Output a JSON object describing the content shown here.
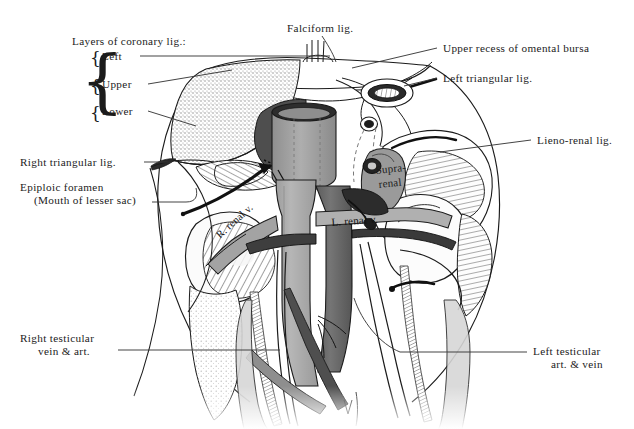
{
  "figure": {
    "background_color": "#ffffff",
    "ink_color": "#1b1b1b"
  },
  "palette": {
    "ink": "#1b1b1b",
    "leader_line": "#3a3a3a",
    "ivc_gray": "#a9a9a9",
    "aorta_dark": "#6b6b6b",
    "vessel_darkest": "#4a4a4a",
    "bare_area_stipple": "#c9c9c9",
    "peritoneum_light": "#e8e8e8",
    "kidney_fill": "#f4f4f4",
    "shadow_gray": "#bdbdbd",
    "white": "#ffffff"
  },
  "labels_left": [
    {
      "id": "layers-heading",
      "text": "Layers of coronary lig.:",
      "x": 72,
      "y": 41
    },
    {
      "id": "layer-left",
      "text": "Left",
      "x": 98,
      "y": 58
    },
    {
      "id": "layer-upper",
      "text": "Upper",
      "x": 98,
      "y": 86
    },
    {
      "id": "layer-lower",
      "text": "Lower",
      "x": 98,
      "y": 113
    },
    {
      "id": "right-triangular-lig",
      "text": "Right triangular lig.",
      "x": 20,
      "y": 163
    },
    {
      "id": "epiploic-foramen-line1",
      "text": "Epiploic foramen",
      "x": 20,
      "y": 187
    },
    {
      "id": "epiploic-foramen-line2",
      "text": "(Mouth of lesser sac)",
      "x": 32,
      "y": 200
    },
    {
      "id": "right-testicular-line1",
      "text": "Right testicular",
      "x": 20,
      "y": 338
    },
    {
      "id": "right-testicular-line2",
      "text": "vein & art.",
      "x": 36,
      "y": 351
    }
  ],
  "labels_right": [
    {
      "id": "upper-recess-omental-bursa",
      "text": "Upper recess of omental bursa",
      "x": 443,
      "y": 48
    },
    {
      "id": "left-triangular-lig",
      "text": "Left triangular lig.",
      "x": 443,
      "y": 78
    },
    {
      "id": "lieno-renal-lig",
      "text": "Lieno-renal lig.",
      "x": 537,
      "y": 141
    },
    {
      "id": "left-testicular-line1",
      "text": "Left testicular",
      "x": 533,
      "y": 351
    },
    {
      "id": "left-testicular-line2",
      "text": "art. & vein",
      "x": 549,
      "y": 364
    }
  ],
  "labels_top": [
    {
      "id": "falciform-lig",
      "text": "Falciform lig.",
      "x": 287,
      "y": 28
    }
  ],
  "labels_overlay": [
    {
      "id": "r-renal-v",
      "text": "R. renal v.",
      "x": 218,
      "y": 238,
      "rotate": -42
    },
    {
      "id": "l-renal-v",
      "text": "L. renal v.",
      "x": 331,
      "y": 222,
      "rotate": -4
    },
    {
      "id": "supra-renal-line1",
      "text": "Supra-",
      "x": 377,
      "y": 171,
      "rotate": -6
    },
    {
      "id": "supra-renal-line2",
      "text": "renal",
      "x": 380,
      "y": 185,
      "rotate": -6
    }
  ],
  "brace": {
    "outer": "{",
    "items": [
      "{",
      "{",
      "{"
    ],
    "x": 86,
    "y_top": 50,
    "height": 76
  },
  "structures": [
    {
      "name": "liver-bare-area",
      "fill": "stipple"
    },
    {
      "name": "inferior-vena-cava",
      "fill": "#a9a9a9"
    },
    {
      "name": "abdominal-aorta",
      "fill": "#6b6b6b"
    },
    {
      "name": "right-kidney",
      "fill": "#fbfbfb"
    },
    {
      "name": "left-kidney",
      "fill": "#fbfbfb"
    },
    {
      "name": "suprarenal-gland",
      "fill": "#9a9a9a"
    },
    {
      "name": "oesophageal-opening",
      "fill": "#ffffff"
    },
    {
      "name": "diaphragm-outline",
      "fill": "none"
    },
    {
      "name": "epiploic-foramen-arrow",
      "fill": "#1b1b1b"
    },
    {
      "name": "psoas-muscle",
      "fill": "#dcdcdc"
    }
  ]
}
